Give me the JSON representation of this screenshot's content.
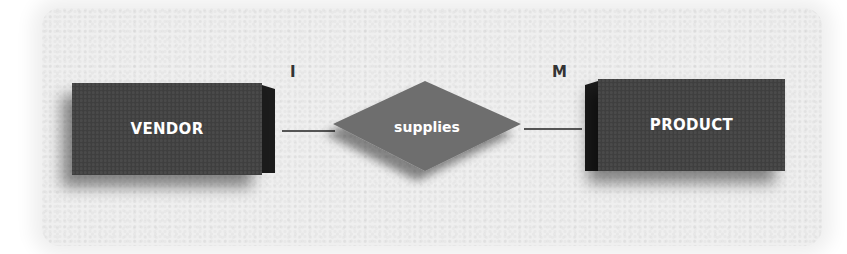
{
  "diagram": {
    "type": "entity-relationship",
    "entities": [
      {
        "id": "vendor",
        "label": "VENDOR"
      },
      {
        "id": "product",
        "label": "PRODUCT"
      }
    ],
    "relationship": {
      "label": "supplies",
      "from": "vendor",
      "to": "product"
    },
    "cardinality": {
      "vendor_side": "I",
      "product_side": "M"
    },
    "colors": {
      "entity_fill": "#3f3f3f",
      "entity_side": "#1c1c1c",
      "relationship_fill": "#6e6e6e",
      "background": "#efefef",
      "text": "#ffffff",
      "connector": "#555555"
    }
  }
}
